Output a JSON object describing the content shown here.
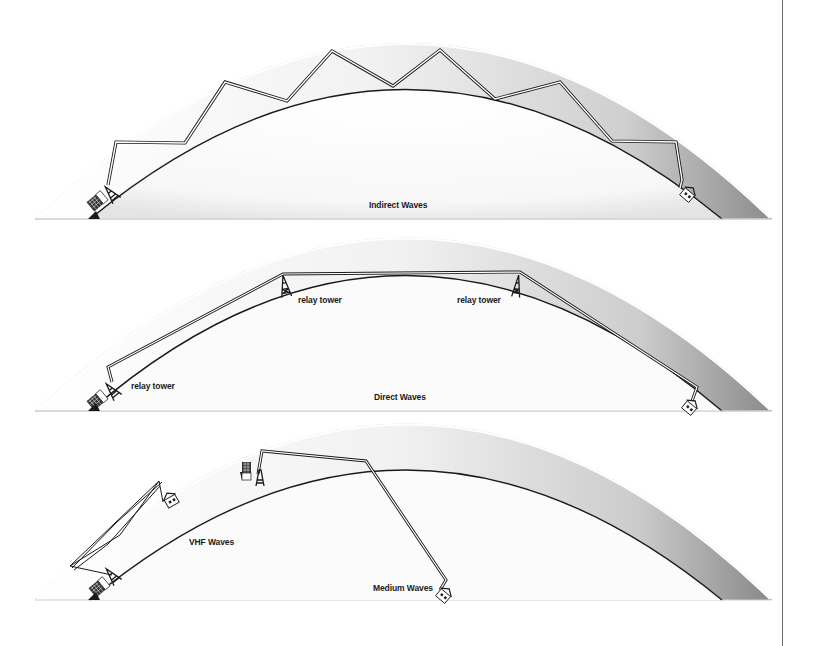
{
  "diagram": {
    "panels": [
      {
        "id": "indirect",
        "caption": "Indirect Waves",
        "description": "Signal bounces repeatedly between ionosphere and Earth surface from transmitter to receiving house",
        "labels": []
      },
      {
        "id": "direct",
        "caption": "Direct Waves",
        "description": "Line-of-sight signal relayed by towers along the Earth's curve",
        "labels": [
          {
            "text": "relay tower"
          },
          {
            "text": "relay tower"
          },
          {
            "text": "relay tower"
          }
        ]
      },
      {
        "id": "medium",
        "caption": "Medium Waves",
        "description": "VHF waves reach a nearby house; medium waves reflect once off upper layer to a distant house",
        "labels": [
          {
            "text": "VHF Waves"
          }
        ]
      }
    ],
    "icons": [
      "transmitter-building-icon",
      "antenna-tower-icon",
      "house-icon",
      "relay-tower-icon"
    ],
    "colors": {
      "line": "#1a1a1a",
      "band_shade": "#9a9a9a",
      "background": "#ffffff",
      "rule": "#6a6a6a"
    }
  }
}
